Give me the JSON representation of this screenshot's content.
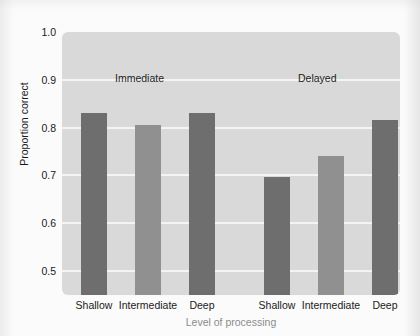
{
  "chart_data": {
    "type": "bar",
    "title": "",
    "xlabel": "Level of processing",
    "ylabel": "Proportion correct",
    "ylim": [
      0.45,
      1.0
    ],
    "yticks": [
      "1.0",
      "0.9",
      "0.8",
      "0.7",
      "0.6",
      "0.5"
    ],
    "ytick_values": [
      1.0,
      0.9,
      0.8,
      0.7,
      0.6,
      0.5
    ],
    "grid": true,
    "legend_position": "none",
    "categories": [
      "Shallow",
      "Intermediate",
      "Deep",
      "Shallow",
      "Intermediate",
      "Deep"
    ],
    "values": [
      0.83,
      0.805,
      0.83,
      0.697,
      0.74,
      0.815
    ],
    "group_labels": [
      "Immediate",
      "Delayed"
    ],
    "groups": [
      {
        "name": "Immediate",
        "categories": [
          "Shallow",
          "Intermediate",
          "Deep"
        ],
        "values": [
          0.83,
          0.805,
          0.83
        ]
      },
      {
        "name": "Delayed",
        "categories": [
          "Shallow",
          "Intermediate",
          "Deep"
        ],
        "values": [
          0.697,
          0.74,
          0.815
        ]
      }
    ],
    "bars": [
      {
        "label": "Shallow",
        "group": "Immediate",
        "value": 0.83,
        "color": "#6e6e6e"
      },
      {
        "label": "Intermediate",
        "group": "Immediate",
        "value": 0.805,
        "color": "#909090"
      },
      {
        "label": "Deep",
        "group": "Immediate",
        "value": 0.83,
        "color": "#6e6e6e"
      },
      {
        "label": "Shallow",
        "group": "Delayed",
        "value": 0.697,
        "color": "#6e6e6e"
      },
      {
        "label": "Intermediate",
        "group": "Delayed",
        "value": 0.74,
        "color": "#909090"
      },
      {
        "label": "Deep",
        "group": "Delayed",
        "value": 0.815,
        "color": "#6e6e6e"
      }
    ],
    "colors": {
      "bar_dark": "#6e6e6e",
      "bar_light": "#909090",
      "plot_background": "#d9d9d9",
      "gridline": "#f4f4f4",
      "axis_text": "#1a1a1a",
      "xlabel_text": "#8c8c8c"
    }
  }
}
